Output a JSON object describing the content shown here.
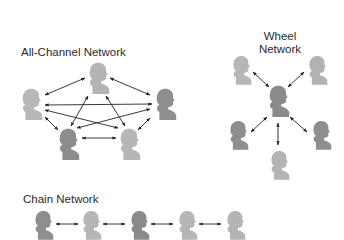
{
  "diagram": {
    "all_channel": {
      "title": "All-Channel Network",
      "nodes": [
        {
          "id": "top",
          "x": 97,
          "y": 76,
          "shade": "#b4b4b4"
        },
        {
          "id": "left",
          "x": 30,
          "y": 102,
          "shade": "#b8b8b8"
        },
        {
          "id": "right",
          "x": 165,
          "y": 102,
          "shade": "#8e8e8e"
        },
        {
          "id": "bottom-left",
          "x": 67,
          "y": 145,
          "shade": "#8c8c8c"
        },
        {
          "id": "bottom-right",
          "x": 128,
          "y": 145,
          "shade": "#b6b6b6"
        }
      ],
      "edges": [
        [
          "top",
          "left"
        ],
        [
          "top",
          "right"
        ],
        [
          "top",
          "bottom-left"
        ],
        [
          "top",
          "bottom-right"
        ],
        [
          "left",
          "right"
        ],
        [
          "left",
          "bottom-left"
        ],
        [
          "left",
          "bottom-right"
        ],
        [
          "right",
          "bottom-left"
        ],
        [
          "right",
          "bottom-right"
        ],
        [
          "bottom-left",
          "bottom-right"
        ]
      ]
    },
    "wheel": {
      "title_line1": "Wheel",
      "title_line2": "Network",
      "nodes": [
        {
          "id": "hub",
          "x": 278,
          "y": 100,
          "shade": "#8a8a8a"
        },
        {
          "id": "top-left",
          "x": 240,
          "y": 70,
          "shade": "#b6b6b6"
        },
        {
          "id": "top-right",
          "x": 316,
          "y": 70,
          "shade": "#b2b2b2"
        },
        {
          "id": "mid-left",
          "x": 238,
          "y": 133,
          "shade": "#8e8e8e"
        },
        {
          "id": "mid-right",
          "x": 318,
          "y": 133,
          "shade": "#8e8e8e"
        },
        {
          "id": "bottom",
          "x": 278,
          "y": 163,
          "shade": "#b4b4b4"
        }
      ]
    },
    "chain": {
      "title": "Chain Network",
      "nodes": [
        {
          "id": "c1",
          "x": 42,
          "y": 224,
          "shade": "#8e8e8e"
        },
        {
          "id": "c2",
          "x": 89,
          "y": 224,
          "shade": "#b6b6b6"
        },
        {
          "id": "c3",
          "x": 138,
          "y": 224,
          "shade": "#8a8a8a"
        },
        {
          "id": "c4",
          "x": 186,
          "y": 224,
          "shade": "#b6b6b6"
        },
        {
          "id": "c5",
          "x": 234,
          "y": 224,
          "shade": "#b4b4b4"
        }
      ]
    },
    "colors": {
      "arrow": "#222222",
      "text": "#2a2a2a",
      "background": "#ffffff"
    }
  }
}
